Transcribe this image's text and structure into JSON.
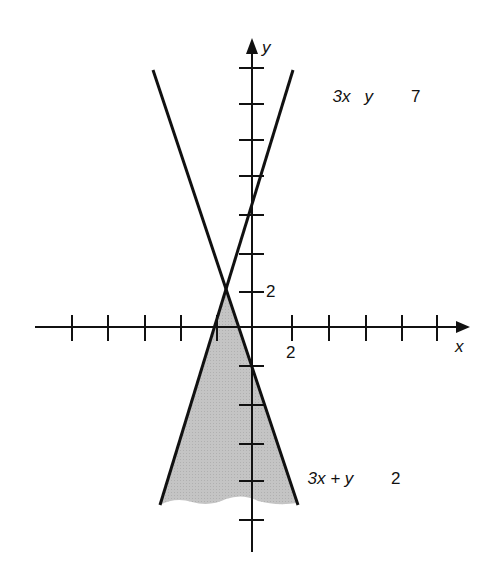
{
  "figure": {
    "type": "graph-of-linear-inequality-system",
    "axes": {
      "x_label": "x",
      "y_label": "y",
      "x_tick_label": "2",
      "y_tick_label": "2"
    },
    "lines": [
      {
        "label_parts": [
          "3x",
          "y",
          "7"
        ],
        "label_text": "3x   y      7",
        "description": "steep line rising to upper right"
      },
      {
        "label_parts": [
          "3x + y",
          "2"
        ],
        "label_text": "3x + y      2",
        "description": "steep line falling to lower right"
      }
    ],
    "shaded_region": {
      "description": "region below intersection bounded by both lines",
      "fill": "#c8c8c8"
    },
    "colors": {
      "line": "#111111",
      "fill": "#c8c8c8",
      "background": "#ffffff"
    }
  }
}
